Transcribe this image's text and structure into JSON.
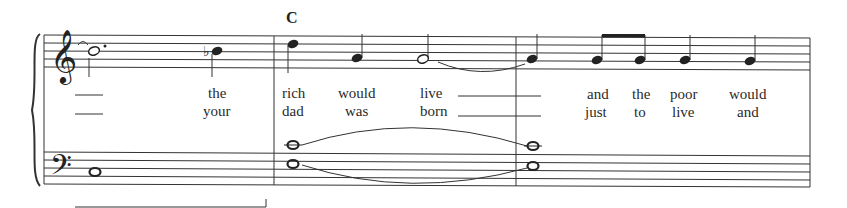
{
  "score": {
    "chord_symbols": [
      {
        "label": "C",
        "x": 286,
        "y": 9
      }
    ],
    "clefs": {
      "treble": "treble-clef",
      "bass": "bass-clef"
    },
    "measures": 3,
    "lyrics": {
      "verse1": [
        {
          "text": "the",
          "x": 208
        },
        {
          "text": "rich",
          "x": 282
        },
        {
          "text": "would",
          "x": 338
        },
        {
          "text": "live",
          "x": 420
        },
        {
          "text": "and",
          "x": 587
        },
        {
          "text": "the",
          "x": 632
        },
        {
          "text": "poor",
          "x": 670
        },
        {
          "text": "would",
          "x": 729
        }
      ],
      "verse2": [
        {
          "text": "your",
          "x": 203
        },
        {
          "text": "dad",
          "x": 282
        },
        {
          "text": "was",
          "x": 345
        },
        {
          "text": "born",
          "x": 420
        },
        {
          "text": "just",
          "x": 585
        },
        {
          "text": "to",
          "x": 634
        },
        {
          "text": "live",
          "x": 672
        },
        {
          "text": "and",
          "x": 737
        }
      ]
    },
    "colors": {
      "ink": "#222222",
      "background": "#ffffff"
    }
  }
}
